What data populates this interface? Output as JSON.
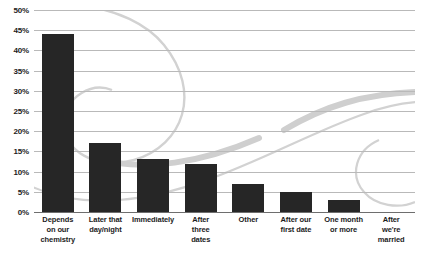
{
  "chart_data": {
    "type": "bar",
    "title": "",
    "xlabel": "",
    "ylabel": "",
    "ylim": [
      0,
      50
    ],
    "ytick_step": 5,
    "grid": true,
    "legend": "none",
    "orientation": "vertical",
    "bar_color": "#262626",
    "gridline_color": "#b9b9b9",
    "axis_color": "#6e6e6e",
    "background_decoration": "gray-swirl-watermark",
    "categories": [
      "Depends on our chemistry",
      "Later that day/night",
      "Immediately",
      "After three dates",
      "Other",
      "After our first date",
      "One month or more",
      "After we're married"
    ],
    "category_lines": [
      [
        "Depends",
        "on our",
        "chemistry"
      ],
      [
        "Later that",
        "day/night"
      ],
      [
        "Immediately"
      ],
      [
        "After",
        "three",
        "dates"
      ],
      [
        "Other"
      ],
      [
        "After our",
        "first date"
      ],
      [
        "One month",
        "or more"
      ],
      [
        "After",
        "we're",
        "married"
      ]
    ],
    "values": [
      44,
      17,
      13,
      12,
      7,
      5,
      3,
      0
    ],
    "ytick_labels": [
      "0%",
      "5%",
      "10%",
      "15%",
      "20%",
      "25%",
      "30%",
      "35%",
      "40%",
      "45%",
      "50%"
    ],
    "ytick_values": [
      0,
      5,
      10,
      15,
      20,
      25,
      30,
      35,
      40,
      45,
      50
    ]
  }
}
